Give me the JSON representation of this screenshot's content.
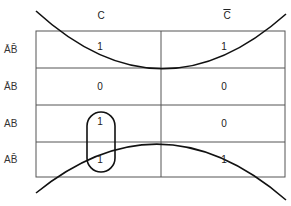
{
  "kmap": {
    "columns": [
      {
        "label": "C",
        "overline": false
      },
      {
        "label": "C",
        "overline": true
      }
    ],
    "rows": [
      {
        "label": "ĀB̄",
        "values": [
          "1",
          "1"
        ]
      },
      {
        "label": "ĀB",
        "values": [
          "0",
          "0"
        ]
      },
      {
        "label": "AB",
        "values": [
          "1",
          "0"
        ]
      },
      {
        "label": "AB̄",
        "values": [
          "1",
          "1"
        ]
      }
    ],
    "groups": [
      {
        "name": "vertical-loop",
        "cells": [
          "AB-C",
          "AB̄-C"
        ]
      },
      {
        "name": "wraparound-top",
        "cells": [
          "ĀB̄-C",
          "ĀB̄-C̄"
        ]
      },
      {
        "name": "wraparound-bottom",
        "cells": [
          "AB̄-C",
          "AB̄-C̄"
        ]
      }
    ]
  }
}
